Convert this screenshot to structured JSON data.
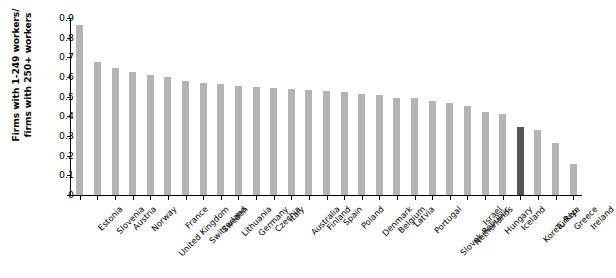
{
  "chart_data": {
    "type": "bar",
    "title": "",
    "subtitle": "",
    "xlabel": "",
    "ylabel": "Firms with 1-249 workers/ firms with 250+ workers",
    "ylabel_lines": [
      "Firms with 1-249 workers/",
      "firms with 250+ workers"
    ],
    "ylim": [
      0,
      0.9
    ],
    "ytick_labels": [
      "0.9",
      "0.8",
      "0.7",
      "0.6",
      "0.5",
      "0.4",
      "0.3",
      "0.2",
      "0.1",
      "0"
    ],
    "ytick_values": [
      0.9,
      0.8,
      0.7,
      0.6,
      0.5,
      0.4,
      0.3,
      0.2,
      0.1,
      0
    ],
    "grid": false,
    "legend": false,
    "legend_position": "none",
    "bar_color": "#b4b4b4",
    "highlight_color": "#555555",
    "highlight_category": "Korea, Rep.",
    "categories": [
      "Estonia",
      "Slovenia",
      "Austria",
      "Norway",
      "United Kingdom",
      "France",
      "Switzerland",
      "Sweden",
      "Lithuania",
      "Germany",
      "Czechia",
      "Italy",
      "Australia",
      "Finland",
      "Spain",
      "Poland",
      "Denmark",
      "Belgium",
      "Latvia",
      "Portugal",
      "Slovak Republic",
      "Netherlands",
      "Israel",
      "Hungary",
      "Iceland",
      "Korea, Rep.",
      "Türkiye",
      "Greece",
      "Ireland"
    ],
    "values": [
      0.865,
      0.678,
      0.645,
      0.625,
      0.608,
      0.598,
      0.58,
      0.568,
      0.562,
      0.555,
      0.548,
      0.545,
      0.54,
      0.535,
      0.53,
      0.525,
      0.512,
      0.508,
      0.495,
      0.492,
      0.48,
      0.47,
      0.455,
      0.42,
      0.412,
      0.348,
      0.332,
      0.262,
      0.158
    ]
  }
}
